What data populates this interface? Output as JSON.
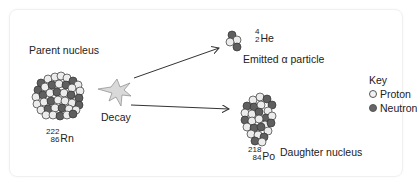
{
  "diagram": {
    "labels": {
      "parent": "Parent nucleus",
      "decay": "Decay",
      "emitted": "Emitted α particle",
      "daughter": "Daughter nucleus"
    },
    "isotopes": {
      "parent": {
        "mass": "222",
        "atomic": "86",
        "symbol": "Rn"
      },
      "alpha": {
        "mass": "4",
        "atomic": "2",
        "symbol": "He"
      },
      "daughter": {
        "mass": "218",
        "atomic": "84",
        "symbol": "Po"
      }
    },
    "key": {
      "title": "Key",
      "items": [
        {
          "label": "Proton",
          "color": "#f2f2f2"
        },
        {
          "label": "Neutron",
          "color": "#666666"
        }
      ]
    },
    "colors": {
      "proton": "#ececec",
      "neutron": "#5f5f5f",
      "outline": "#333333",
      "star": "#d9d9d9",
      "arrow": "#333333"
    }
  }
}
